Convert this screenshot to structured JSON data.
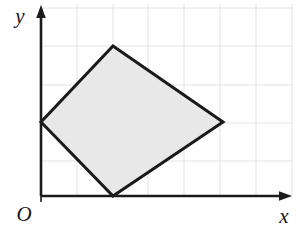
{
  "figure": {
    "background_color": "#ffffff"
  },
  "axes": {
    "origin_label": "O",
    "x_label": "x",
    "y_label": "y",
    "axis_color": "#1b1b1b",
    "axis_line_width": 2.6,
    "x_axis_pixel_y": 196,
    "y_axis_pixel_x": 41,
    "x_axis_arrow_tip_x": 292,
    "y_axis_arrow_tip_y": 6,
    "origin_tick_mark": true
  },
  "grid": {
    "color": "#e2e2e2",
    "line_width": 1,
    "cell_width_px": 35.8,
    "cell_height_px": 38.2,
    "vertical_lines_px": [
      41,
      77,
      113,
      148,
      184,
      220,
      256,
      292
    ],
    "horizontal_lines_px": [
      8,
      46,
      85,
      123,
      161,
      196
    ],
    "columns": 7,
    "rows": 5,
    "visible": true
  },
  "shape": {
    "name": "quadrilateral",
    "type": "kite",
    "fill_color": "#e8e8e8",
    "stroke_color": "#1a1a1a",
    "stroke_width": 3,
    "vertices_px": [
      {
        "name": "top-vertex",
        "x": 113,
        "y": 46
      },
      {
        "name": "right-vertex",
        "x": 223,
        "y": 122
      },
      {
        "name": "bottom-vertex",
        "x": 113,
        "y": 196
      },
      {
        "name": "left-vertex",
        "x": 41,
        "y": 122
      }
    ],
    "vertices_grid_units": [
      {
        "name": "top-vertex",
        "x": 2,
        "y": 4
      },
      {
        "name": "right-vertex",
        "x": 5.1,
        "y": 2
      },
      {
        "name": "bottom-vertex",
        "x": 2,
        "y": 0
      },
      {
        "name": "left-vertex",
        "x": 0,
        "y": 2
      }
    ],
    "points_path": "113,46 223,122 113,196 41,122"
  },
  "chart_data": {
    "type": "scatter",
    "title": "",
    "xlabel": "x",
    "ylabel": "y",
    "xlim": [
      0,
      7
    ],
    "ylim": [
      0,
      5
    ],
    "grid": true,
    "legend": "none",
    "series": [
      {
        "name": "quadrilateral",
        "closed": true,
        "fill": "#e8e8e8",
        "x": [
          2,
          5.1,
          2,
          0
        ],
        "y": [
          4,
          2,
          0,
          2
        ]
      }
    ],
    "annotations": [
      {
        "text": "O",
        "x": 0,
        "y": 0,
        "position": "below-left-of-origin"
      },
      {
        "text": "y",
        "x": 0,
        "y": 5,
        "position": "left-of-y-axis-arrow"
      },
      {
        "text": "x",
        "x": 7,
        "y": 0,
        "position": "below-x-axis-arrow"
      }
    ]
  }
}
